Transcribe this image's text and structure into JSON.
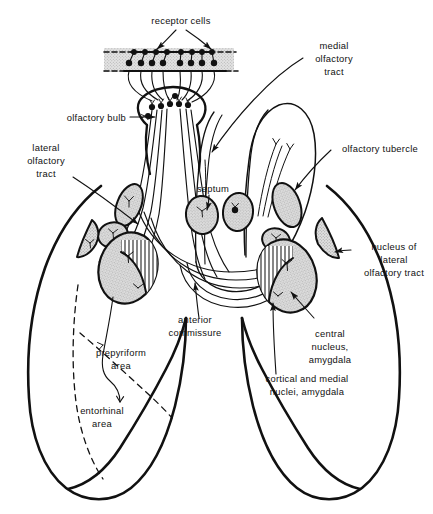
{
  "figure": {
    "type": "anatomical-diagram",
    "background_color": "#ffffff",
    "ink_color": "#111111",
    "nucleus_fill": "#d9d9d9",
    "receptor_band_fill": "#d8d8d8",
    "hatch_color": "#222222"
  },
  "labels": {
    "receptor_cells": "receptor cells",
    "medial_olfactory_tract_l1": "medial",
    "medial_olfactory_tract_l2": "olfactory",
    "medial_olfactory_tract_l3": "tract",
    "olfactory_bulb": "olfactory bulb",
    "lateral_olfactory_tract_l1": "lateral",
    "lateral_olfactory_tract_l2": "olfactory",
    "lateral_olfactory_tract_l3": "tract",
    "olfactory_tubercle": "olfactory tubercle",
    "septum": "septum",
    "nucleus_lot_l1": "nucleus of",
    "nucleus_lot_l2": "lateral",
    "nucleus_lot_l3": "olfactory tract",
    "anterior_commissure_l1": "anterior",
    "anterior_commissure_l2": "commissure",
    "central_nucleus_amygdala_l1": "central",
    "central_nucleus_amygdala_l2": "nucleus,",
    "central_nucleus_amygdala_l3": "amygdala",
    "cortical_medial_amygdala_l1": "cortical and medial",
    "cortical_medial_amygdala_l2": "nuclei, amygdala",
    "prepyriform_area_l1": "prepyriform",
    "prepyriform_area_l2": "area",
    "entorhinal_area_l1": "entorhinal",
    "entorhinal_area_l2": "area"
  },
  "structures": {
    "receptor_cell_count_upper": 8,
    "receptor_cell_count_lower": 8,
    "olfactory_bulb_glomeruli": 7,
    "septal_nuclei": 2,
    "shaded_nuclei_left": 4,
    "shaded_nuclei_right": 4
  }
}
